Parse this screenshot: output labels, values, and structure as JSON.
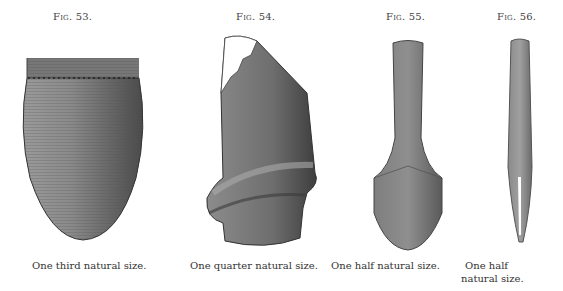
{
  "figures": [
    {
      "label": "Fig. 53.",
      "caption": "One third natural size.",
      "subject": "vessel-basket"
    },
    {
      "label": "Fig. 54.",
      "caption": "One quarter natural size.",
      "subject": "stone-implement-ridged"
    },
    {
      "label": "Fig. 55.",
      "caption": "One half natural size.",
      "subject": "stone-pestle"
    },
    {
      "label": "Fig. 56.",
      "caption_line1": "One half",
      "caption_line2": "natural size.",
      "subject": "bone-tool"
    }
  ],
  "colors": {
    "ink": "#3a3a3a",
    "shade": "#6b6b6b",
    "light": "#9a9a9a",
    "paper": "#ffffff"
  }
}
